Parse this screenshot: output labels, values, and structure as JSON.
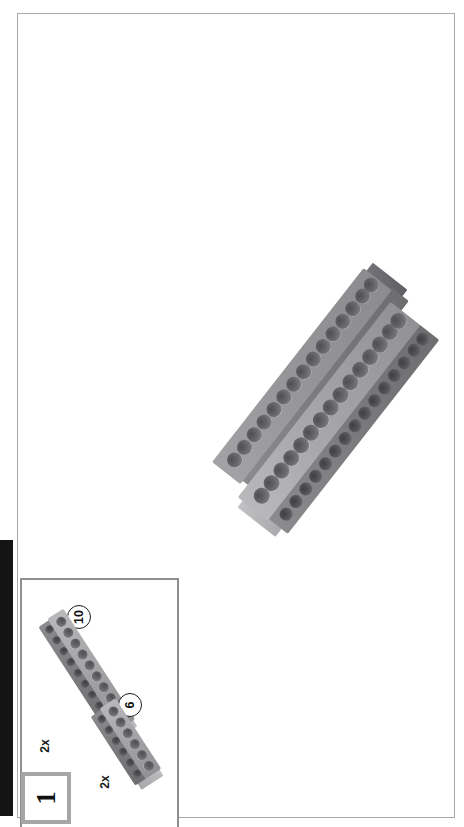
{
  "page": {
    "kind": "lego-building-instruction-page",
    "orientation": "rotated-90-ccw",
    "background_color": "#ffffff",
    "border_color": "#a9a9ac",
    "edge_marker_color": "#141414"
  },
  "step": {
    "number": "1",
    "box_border_color": "#a6a6a9"
  },
  "parts_callout": {
    "border_color": "#8e8e92",
    "parts": [
      {
        "id": "part-beam-10",
        "length_label": "10",
        "quantity_label": "2x",
        "description": "technic-beam-10-holes",
        "color": "#a8a8ab"
      },
      {
        "id": "part-beam-6",
        "length_label": "6",
        "quantity_label": "2x",
        "description": "technic-beam-6-holes",
        "color": "#a8a8ab"
      }
    ]
  },
  "assembly": {
    "id": "main-assembly",
    "description": "two-technic-beams-placed-side-by-side",
    "beam_count": 2,
    "holes_per_beam": 15,
    "color": "#a2a2a5",
    "shadow_color": "#6e6e71"
  }
}
